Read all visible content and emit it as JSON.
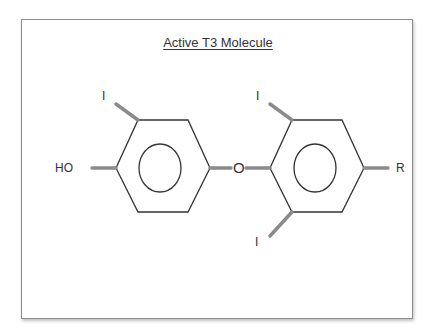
{
  "diagram": {
    "title": "Active T3 Molecule",
    "atoms": {
      "ring1_top_iodine": "I",
      "hydroxyl": "HO",
      "ether_oxygen": "O",
      "ring2_top_iodine": "I",
      "ring2_bottom_iodine": "I",
      "r_group": "R"
    },
    "colors": {
      "bond": "#333333",
      "substituent_bond": "#8a8a8a",
      "frame_border": "#8c8c8c",
      "text": "#333333"
    }
  }
}
